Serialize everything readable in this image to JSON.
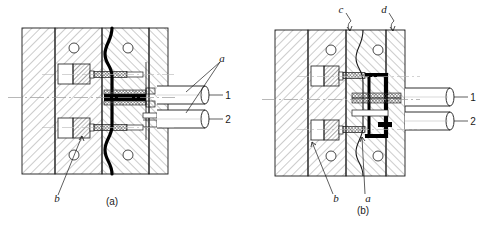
{
  "figure": {
    "background": "#ffffff",
    "line_color": "#1a1a1a",
    "hatch_color": "#6b6b6b",
    "heavy_color": "#000000",
    "centerline_color": "#9a9a9a"
  },
  "panels": [
    {
      "id": "a",
      "caption": "(a)",
      "labels": [
        {
          "key": "a",
          "text": "a",
          "style": "italic"
        },
        {
          "key": "b",
          "text": "b",
          "style": "italic"
        },
        {
          "key": "1",
          "text": "1",
          "style": "plain"
        },
        {
          "key": "2",
          "text": "2",
          "style": "plain"
        }
      ]
    },
    {
      "id": "b",
      "caption": "(b)",
      "labels": [
        {
          "key": "c",
          "text": "c",
          "style": "italic"
        },
        {
          "key": "d",
          "text": "d",
          "style": "italic"
        },
        {
          "key": "a",
          "text": "a",
          "style": "italic"
        },
        {
          "key": "b",
          "text": "b",
          "style": "italic"
        },
        {
          "key": "1",
          "text": "1",
          "style": "plain"
        },
        {
          "key": "2",
          "text": "2",
          "style": "plain"
        }
      ]
    }
  ],
  "callouts": {
    "panel_a_a": "a",
    "panel_a_b": "b",
    "panel_a_1": "1",
    "panel_a_2": "2",
    "panel_a_caption": "(a)",
    "panel_b_c": "c",
    "panel_b_d": "d",
    "panel_b_a": "a",
    "panel_b_b": "b",
    "panel_b_1": "1",
    "panel_b_2": "2",
    "panel_b_caption": "(b)"
  }
}
